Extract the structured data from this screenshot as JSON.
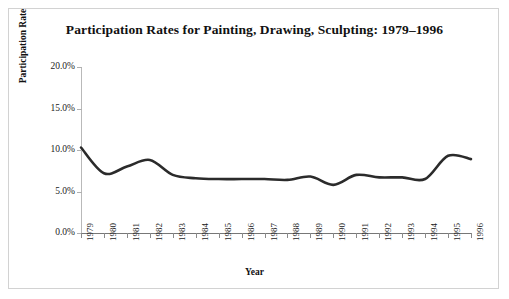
{
  "chart_data": {
    "type": "line",
    "title": "Participation Rates for Painting, Drawing, Sculpting: 1979–1996",
    "xlabel": "Year",
    "ylabel": "Participation Rate",
    "categories": [
      "1979",
      "1980",
      "1981",
      "1982",
      "1983",
      "1984",
      "1985",
      "1986",
      "1987",
      "1988",
      "1989",
      "1990",
      "1991",
      "1992",
      "1993",
      "1994",
      "1995",
      "1996"
    ],
    "x": [
      1979,
      1980,
      1981,
      1982,
      1983,
      1984,
      1985,
      1986,
      1987,
      1988,
      1989,
      1990,
      1991,
      1992,
      1993,
      1994,
      1995,
      1996
    ],
    "values": [
      10.3,
      7.2,
      8.0,
      8.8,
      7.0,
      6.6,
      6.5,
      6.5,
      6.5,
      6.4,
      6.8,
      5.8,
      7.0,
      6.7,
      6.7,
      6.5,
      9.3,
      8.9
    ],
    "series": [
      {
        "name": "Participation Rate",
        "values": [
          10.3,
          7.2,
          8.0,
          8.8,
          7.0,
          6.6,
          6.5,
          6.5,
          6.5,
          6.4,
          6.8,
          5.8,
          7.0,
          6.7,
          6.7,
          6.5,
          9.3,
          8.9
        ],
        "color": "#2b2b2b"
      }
    ],
    "ylim": [
      0,
      20
    ],
    "ytick_values": [
      0,
      5,
      10,
      15,
      20
    ],
    "ytick_labels": [
      "0.0%",
      "5.0%",
      "10.0%",
      "15.0%",
      "20.0%"
    ],
    "grid": false,
    "legend": "none",
    "line_color": "#2b2b2b",
    "line_width": 2.6,
    "axis_color": "#8a8a8a",
    "background": "#ffffff",
    "border_color": "#d2d2d2"
  }
}
